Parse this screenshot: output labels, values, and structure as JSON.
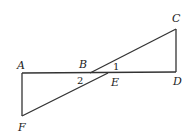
{
  "diagram": {
    "type": "geometry",
    "points": {
      "A": {
        "label": "A"
      },
      "B": {
        "label": "B"
      },
      "C": {
        "label": "C"
      },
      "D": {
        "label": "D"
      },
      "E": {
        "label": "E"
      },
      "F": {
        "label": "F"
      }
    },
    "angles": {
      "angle1": {
        "label": "1"
      },
      "angle2": {
        "label": "2"
      }
    },
    "segments": [
      "AD",
      "CD",
      "AF",
      "CB",
      "FE"
    ]
  }
}
